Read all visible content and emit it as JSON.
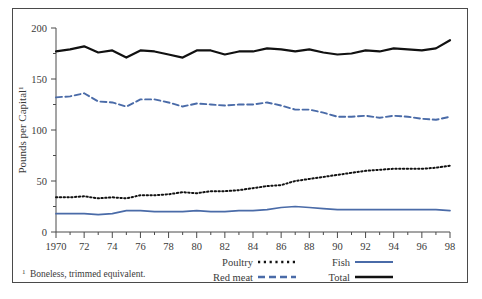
{
  "chart_data": {
    "type": "line",
    "title": "",
    "xlabel": "",
    "ylabel": "Pounds per Capital",
    "ylabel_superscript": "1",
    "xlim": [
      1970,
      1998
    ],
    "ylim": [
      0,
      200
    ],
    "yticks": [
      0,
      50,
      100,
      150,
      200
    ],
    "ytick_labels": [
      "0",
      "50",
      "100",
      "150",
      "200"
    ],
    "xticks": [
      1970,
      1971,
      1972,
      1973,
      1974,
      1975,
      1976,
      1977,
      1978,
      1979,
      1980,
      1981,
      1982,
      1983,
      1984,
      1985,
      1986,
      1987,
      1988,
      1989,
      1990,
      1991,
      1992,
      1993,
      1994,
      1995,
      1996,
      1997,
      1998
    ],
    "xtick_labels": [
      "1970",
      "72",
      "74",
      "76",
      "78",
      "80",
      "82",
      "84",
      "86",
      "88",
      "90",
      "92",
      "94",
      "96",
      "98"
    ],
    "xtick_label_years": [
      1970,
      1972,
      1974,
      1976,
      1978,
      1980,
      1982,
      1984,
      1986,
      1988,
      1990,
      1992,
      1994,
      1996,
      1998
    ],
    "grid": false,
    "legend_position": "bottom",
    "x": [
      1970,
      1971,
      1972,
      1973,
      1974,
      1975,
      1976,
      1977,
      1978,
      1979,
      1980,
      1981,
      1982,
      1983,
      1984,
      1985,
      1986,
      1987,
      1988,
      1989,
      1990,
      1991,
      1992,
      1993,
      1994,
      1995,
      1996,
      1997,
      1998
    ],
    "series": [
      {
        "name": "Total",
        "color": "#111111",
        "style": "solid",
        "values": [
          177,
          179,
          182,
          176,
          178,
          171,
          178,
          177,
          174,
          171,
          178,
          178,
          174,
          177,
          177,
          180,
          179,
          177,
          179,
          176,
          174,
          175,
          178,
          177,
          180,
          179,
          178,
          180,
          188
        ]
      },
      {
        "name": "Red meat",
        "color": "#4a6ba8",
        "style": "dashed",
        "values": [
          132,
          133,
          136,
          128,
          127,
          123,
          130,
          130,
          127,
          123,
          126,
          125,
          124,
          125,
          125,
          127,
          124,
          120,
          120,
          117,
          113,
          113,
          114,
          112,
          114,
          113,
          111,
          110,
          113
        ]
      },
      {
        "name": "Poultry",
        "color": "#111111",
        "style": "dotted",
        "values": [
          34,
          34,
          35,
          33,
          34,
          33,
          36,
          36,
          37,
          39,
          38,
          40,
          40,
          41,
          43,
          45,
          46,
          50,
          52,
          54,
          56,
          58,
          60,
          61,
          62,
          62,
          62,
          63,
          65
        ]
      },
      {
        "name": "Fish",
        "color": "#4a6ba8",
        "style": "solid",
        "values": [
          18,
          18,
          18,
          17,
          18,
          21,
          21,
          20,
          20,
          20,
          21,
          20,
          20,
          21,
          21,
          22,
          24,
          25,
          24,
          23,
          22,
          22,
          22,
          22,
          22,
          22,
          22,
          22,
          21
        ]
      }
    ]
  },
  "legend": {
    "items": [
      {
        "label": "Poultry",
        "color": "#111111",
        "style": "dotted"
      },
      {
        "label": "Fish",
        "color": "#4a6ba8",
        "style": "solid"
      },
      {
        "label": "Red meat",
        "color": "#4a6ba8",
        "style": "dashed"
      },
      {
        "label": "Total",
        "color": "#111111",
        "style": "solid"
      }
    ]
  },
  "footnote": {
    "marker": "1",
    "text": "Boneless, trimmed equivalent."
  },
  "colors": {
    "blue": "#4a6ba8",
    "black": "#111111",
    "axis": "#4a4a4a",
    "text": "#3a3a3a",
    "frame": "#4a4a4a",
    "background": "#ffffff"
  }
}
